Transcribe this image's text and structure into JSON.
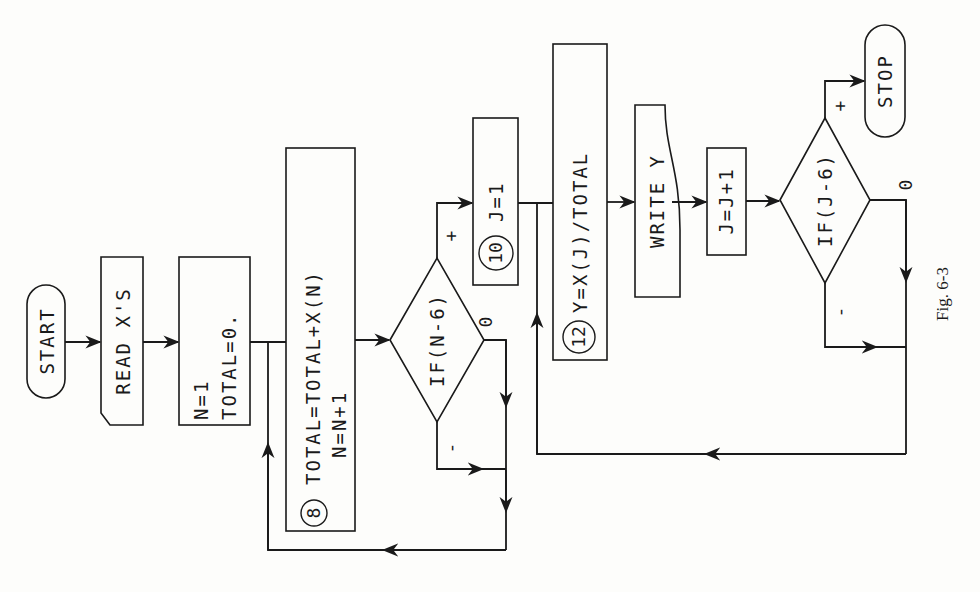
{
  "figure": {
    "caption": "Fig. 6-3",
    "orientation": "rotated 90° counter-clockwise"
  },
  "nodes": {
    "start": {
      "label": "START",
      "shape": "terminal"
    },
    "read": {
      "label": "READ X'S",
      "shape": "input"
    },
    "init": {
      "line1": "N=1",
      "line2": "TOTAL=0.",
      "shape": "process"
    },
    "accumulate": {
      "number": "8",
      "line1": "TOTAL=TOTAL+X(N)",
      "line2": "N=N+1",
      "shape": "process"
    },
    "test_n": {
      "label": "IF(N-6)",
      "shape": "decision"
    },
    "set_j": {
      "number": "10",
      "label": "J=1",
      "shape": "process"
    },
    "compute_y": {
      "number": "12",
      "label": "Y=X(J)/TOTAL",
      "shape": "process"
    },
    "write": {
      "label": "WRITE Y",
      "shape": "output"
    },
    "inc_j": {
      "label": "J=J+1",
      "shape": "process"
    },
    "test_j": {
      "label": "IF(J-6)",
      "shape": "decision"
    },
    "stop": {
      "label": "STOP",
      "shape": "terminal"
    }
  },
  "branches": {
    "test_n": {
      "minus": "-",
      "zero": "0",
      "plus": "+"
    },
    "test_j": {
      "minus": "-",
      "zero": "0",
      "plus": "+"
    }
  },
  "edges": [
    {
      "from": "start",
      "to": "read"
    },
    {
      "from": "read",
      "to": "init"
    },
    {
      "from": "init",
      "to": "accumulate"
    },
    {
      "from": "accumulate",
      "to": "test_n"
    },
    {
      "from": "test_n",
      "to": "accumulate",
      "branch": "-"
    },
    {
      "from": "test_n",
      "to": "accumulate",
      "branch": "0"
    },
    {
      "from": "test_n",
      "to": "set_j",
      "branch": "+"
    },
    {
      "from": "set_j",
      "to": "compute_y"
    },
    {
      "from": "compute_y",
      "to": "write"
    },
    {
      "from": "write",
      "to": "inc_j"
    },
    {
      "from": "inc_j",
      "to": "test_j"
    },
    {
      "from": "test_j",
      "to": "compute_y",
      "branch": "-"
    },
    {
      "from": "test_j",
      "to": "compute_y",
      "branch": "0"
    },
    {
      "from": "test_j",
      "to": "stop",
      "branch": "+"
    }
  ]
}
